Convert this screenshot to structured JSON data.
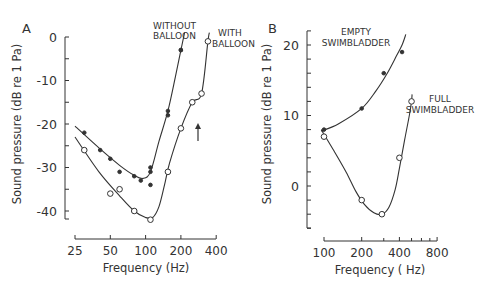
{
  "chart_data": [
    {
      "panel": "A",
      "type": "line",
      "title": "",
      "xlabel": "Frequency (Hz)",
      "ylabel": "Sound pressure (dB re 1 Pa)",
      "xscale": "log",
      "xticks": [
        25,
        50,
        100,
        200,
        400
      ],
      "yticks": [
        0,
        -10,
        -20,
        -30,
        -40
      ],
      "xlim": [
        25,
        400
      ],
      "ylim": [
        -43,
        2
      ],
      "grid": false,
      "annotations": [
        {
          "text": "↑",
          "x": 280,
          "y": -23,
          "kind": "arrow"
        }
      ],
      "series": [
        {
          "name": "WITHOUT BALLOON",
          "marker": "filled-circle",
          "points": [
            [
              30,
              -22
            ],
            [
              41,
              -26
            ],
            [
              50,
              -28
            ],
            [
              60,
              -31
            ],
            [
              80,
              -32
            ],
            [
              91,
              -33
            ],
            [
              110,
              -30
            ],
            [
              110,
              -31
            ],
            [
              110,
              -34
            ],
            [
              155,
              -17
            ],
            [
              155,
              -18
            ],
            [
              200,
              -3
            ],
            [
              200,
              -3
            ]
          ],
          "curve": [
            [
              25,
              -20.5
            ],
            [
              40,
              -25.5
            ],
            [
              60,
              -29.5
            ],
            [
              80,
              -31.8
            ],
            [
              95,
              -32.5
            ],
            [
              110,
              -31
            ],
            [
              130,
              -24
            ],
            [
              155,
              -17
            ],
            [
              180,
              -9
            ],
            [
              200,
              -3
            ],
            [
              215,
              1
            ]
          ]
        },
        {
          "name": "WITH BALLOON",
          "marker": "open-circle",
          "points": [
            [
              30,
              -26
            ],
            [
              50,
              -36
            ],
            [
              60,
              -35
            ],
            [
              80,
              -40
            ],
            [
              110,
              -42
            ],
            [
              155,
              -31
            ],
            [
              200,
              -21
            ],
            [
              250,
              -15
            ],
            [
              300,
              -13
            ],
            [
              340,
              -1
            ]
          ],
          "curve": [
            [
              25,
              -23
            ],
            [
              40,
              -31
            ],
            [
              60,
              -36.5
            ],
            [
              80,
              -40
            ],
            [
              100,
              -41.5
            ],
            [
              115,
              -41.5
            ],
            [
              130,
              -39
            ],
            [
              145,
              -34
            ],
            [
              160,
              -29
            ],
            [
              200,
              -21
            ],
            [
              250,
              -15
            ],
            [
              300,
              -13
            ],
            [
              340,
              -1
            ],
            [
              350,
              1
            ]
          ]
        }
      ]
    },
    {
      "panel": "B",
      "type": "line",
      "title": "",
      "xlabel": "Frequency (Hz)",
      "ylabel": "Sound pressure (dB re 1 Pa)",
      "xscale": "log",
      "xticks": [
        100,
        200,
        400,
        800
      ],
      "yticks": [
        20,
        10,
        0
      ],
      "xlim": [
        100,
        800
      ],
      "ylim": [
        -6,
        22
      ],
      "grid": false,
      "series": [
        {
          "name": "EMPTY SWIMBLADDER",
          "marker": "filled-circle",
          "points": [
            [
              100,
              8
            ],
            [
              200,
              11
            ],
            [
              300,
              16
            ],
            [
              420,
              19
            ]
          ],
          "curve": [
            [
              95,
              7.8
            ],
            [
              130,
              8.8
            ],
            [
              200,
              11
            ],
            [
              260,
              13.5
            ],
            [
              320,
              16
            ],
            [
              380,
              18.5
            ],
            [
              420,
              20
            ],
            [
              450,
              21.5
            ]
          ]
        },
        {
          "name": "FULL SWIMBLADDER",
          "marker": "open-circle",
          "points": [
            [
              100,
              7
            ],
            [
              200,
              -2
            ],
            [
              290,
              -4
            ],
            [
              400,
              4
            ],
            [
              500,
              12
            ]
          ],
          "curve": [
            [
              95,
              8
            ],
            [
              120,
              5
            ],
            [
              150,
              2
            ],
            [
              180,
              -0.8
            ],
            [
              210,
              -2.6
            ],
            [
              250,
              -3.8
            ],
            [
              290,
              -4
            ],
            [
              330,
              -3
            ],
            [
              370,
              -0.5
            ],
            [
              400,
              2.5
            ],
            [
              440,
              6.5
            ],
            [
              480,
              10
            ],
            [
              500,
              12
            ],
            [
              505,
              13
            ]
          ]
        }
      ]
    }
  ],
  "labels": {
    "panel_a": "A",
    "panel_b": "B",
    "without_balloon": [
      "WITHOUT",
      "BALLOON"
    ],
    "with_balloon": [
      "WITH",
      "BALLOON"
    ],
    "empty_swimbladder": [
      "EMPTY",
      "SWIMBLADDER"
    ],
    "full_swimbladder": [
      "FULL",
      "SWIMBLADDER"
    ],
    "xlabel": "Frequency (Hz)",
    "xlabel_b": "Frequency ( Hz)",
    "ylabel": "Sound pressure (dB re 1 Pa)"
  },
  "colors": {
    "ink": "#333333",
    "background": "#ffffff"
  }
}
